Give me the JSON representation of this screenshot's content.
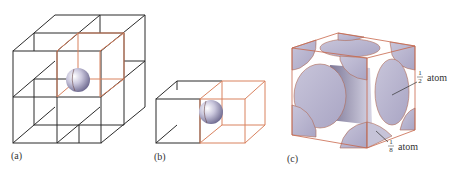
{
  "figure": {
    "panels": [
      {
        "id": "a",
        "label": "(a)",
        "description": "2x2x2 cubic lattice with one highlighted unit cell and an atom at the shared corner"
      },
      {
        "id": "b",
        "label": "(b)",
        "description": "Two adjacent cubic cells sharing a face, atom at shared edge"
      },
      {
        "id": "c",
        "label": "(c)",
        "description": "Face-centered cubic unit cell showing atom fractions"
      }
    ],
    "annotations": {
      "half_atom": {
        "numerator": "1",
        "denominator": "2",
        "text": "atom"
      },
      "eighth_atom": {
        "numerator": "1",
        "denominator": "8",
        "text": "atom"
      }
    },
    "colors": {
      "lattice_line": "#2a2a2a",
      "highlight_cell": "#d9825f",
      "atom_fill": "#b8b4d0",
      "atom_shadow": "#8a85a8"
    }
  }
}
